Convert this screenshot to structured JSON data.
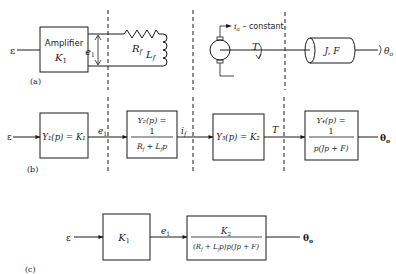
{
  "panel_a": {
    "label": "(a)",
    "input": "ε",
    "amplifier_title": "Amplifier",
    "amplifier_gain": "K",
    "amplifier_gain_sub": "1",
    "voltage": "e",
    "voltage_sub": "1",
    "resistor": "R",
    "resistor_sub": "f",
    "inductor": "L",
    "inductor_sub": "f",
    "armature_current": "i",
    "armature_current_sub": "a",
    "armature_note": " – constant",
    "torque": "T",
    "load": "J, F",
    "output": "θ",
    "output_sub": "o"
  },
  "panel_b": {
    "label": "(b)",
    "input": "ε",
    "block1": "Y₁(p) = K₁",
    "signal1": "e",
    "signal1_sub": "1",
    "block2_top": "Y₂(p) =",
    "block2_num": "1",
    "block2_den": "R_f + L_f p",
    "block2_den_display": "R",
    "signal2": "i",
    "signal2_sub": "f",
    "block3": "Y₃(p) = K₂",
    "signal3": "T",
    "block4_top": "Y₄(p) =",
    "block4_num": "1",
    "block4_den": "p(Jp + F)",
    "output": "θ",
    "output_sub": "o"
  },
  "panel_c": {
    "label": "(c)",
    "input": "ε",
    "block1": "K",
    "block1_sub": "1",
    "signal1": "e",
    "signal1_sub": "1",
    "block2_num": "K",
    "block2_num_sub": "2",
    "block2_den": "(R_f + L_f p)p(Jp + F)",
    "output": "θ",
    "output_sub": "o"
  },
  "colors": {
    "ink": "#1a1a1a",
    "background": "#ffffff"
  }
}
